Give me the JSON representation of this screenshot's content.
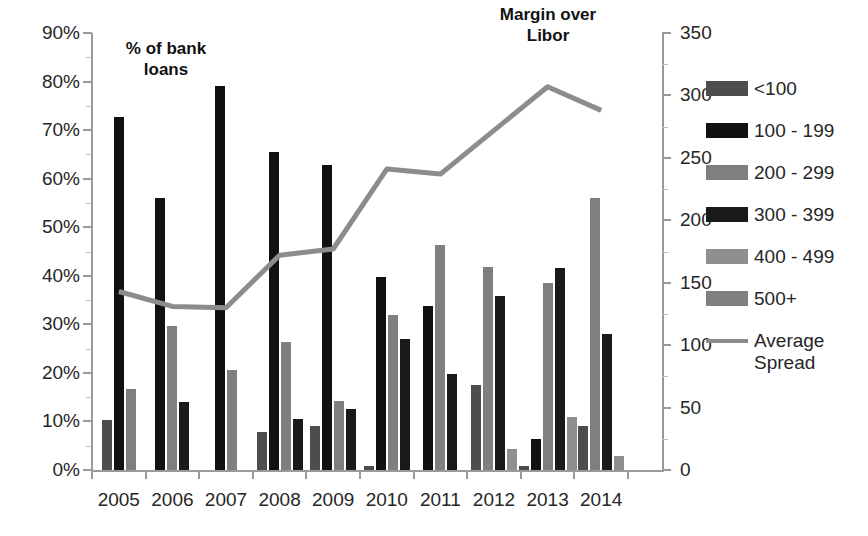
{
  "chart_data": {
    "type": "bar",
    "title": "",
    "subtitle": "",
    "categories": [
      "2005",
      "2006",
      "2007",
      "2008",
      "2009",
      "2010",
      "2011",
      "2012",
      "2013",
      "2014"
    ],
    "series": [
      {
        "name": "<100",
        "color": "#4d4d4d",
        "values": [
          10.2,
          0,
          0,
          7.8,
          9.0,
          0.9,
          0,
          17.5,
          0.8,
          9.0
        ]
      },
      {
        "name": "100 - 199",
        "color": "#111111",
        "values": [
          72.8,
          56.0,
          79.0,
          65.5,
          62.8,
          39.7,
          33.8,
          0,
          6.4,
          0
        ]
      },
      {
        "name": "200 - 299",
        "color": "#7f7f7f",
        "values": [
          16.6,
          29.6,
          20.6,
          26.3,
          14.3,
          32.0,
          46.3,
          41.8,
          38.5,
          56.0
        ]
      },
      {
        "name": "300 - 399",
        "color": "#1a1a1a",
        "values": [
          0,
          14.0,
          0,
          10.6,
          12.6,
          27.0,
          19.8,
          35.8,
          41.7,
          28.0
        ]
      },
      {
        "name": "400 - 499",
        "color": "#8f8f8f",
        "values": [
          0,
          0,
          0,
          0,
          0,
          0,
          0,
          4.4,
          11.0,
          2.8
        ]
      },
      {
        "name": "500+",
        "color": "#808080",
        "values": [
          0,
          0,
          0,
          0,
          0,
          0,
          0,
          0,
          0,
          0
        ]
      }
    ],
    "line_series": {
      "name": "Average Spread",
      "color": "#8c8c8c",
      "values": [
        143,
        131,
        130,
        172,
        177,
        241,
        237,
        272,
        307,
        288
      ]
    },
    "xlabel": "",
    "ylabel_left": "% of bank\nloans",
    "ylabel_right": "Margin over\nLibor",
    "yticks_left": [
      "0%",
      "10%",
      "20%",
      "30%",
      "40%",
      "50%",
      "60%",
      "70%",
      "80%",
      "90%"
    ],
    "yticks_right": [
      "0",
      "50",
      "100",
      "150",
      "200",
      "250",
      "300",
      "350"
    ],
    "ylim_left": [
      0,
      90
    ],
    "ylim_right": [
      0,
      350
    ],
    "grid": false,
    "legend_position": "right"
  },
  "axes": {
    "left_ticks": [
      "90%",
      "80%",
      "70%",
      "60%",
      "50%",
      "40%",
      "30%",
      "20%",
      "10%",
      "0%"
    ],
    "right_ticks": [
      "350",
      "300",
      "250",
      "200",
      "150",
      "100",
      "50",
      "0"
    ],
    "categories": [
      "2005",
      "2006",
      "2007",
      "2008",
      "2009",
      "2010",
      "2011",
      "2012",
      "2013",
      "2014"
    ]
  },
  "annotations": {
    "left_axis_title": "% of bank\nloans",
    "right_axis_title": "Margin over\nLibor"
  },
  "legend": {
    "entries": [
      {
        "label": "<100",
        "color": "#4d4d4d",
        "kind": "swatch"
      },
      {
        "label": "100 - 199",
        "color": "#111111",
        "kind": "swatch"
      },
      {
        "label": "200 - 299",
        "color": "#7f7f7f",
        "kind": "swatch"
      },
      {
        "label": "300 - 399",
        "color": "#1a1a1a",
        "kind": "swatch"
      },
      {
        "label": "400 - 499",
        "color": "#8f8f8f",
        "kind": "swatch"
      },
      {
        "label": "500+",
        "color": "#808080",
        "kind": "swatch"
      },
      {
        "label": "Average\nSpread",
        "color": "#8c8c8c",
        "kind": "line"
      }
    ]
  }
}
